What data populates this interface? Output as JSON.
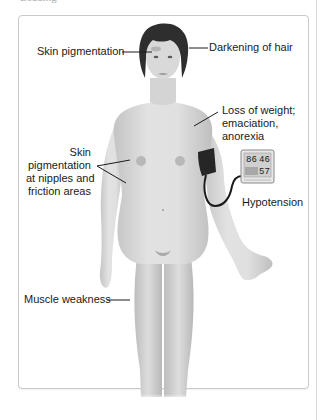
{
  "figure": {
    "caption_fragment": "Loading",
    "labels": {
      "skin_pigmentation_face": "Skin pigmentation",
      "darkening_of_hair": "Darkening of hair",
      "weight_loss": [
        "Loss of weight;",
        "emaciation,",
        "anorexia"
      ],
      "skin_pigmentation_body": [
        "Skin",
        "pigmentation",
        "at nipples and",
        "friction areas"
      ],
      "hypotension": "Hypotension",
      "muscle_weakness": "Muscle weakness"
    },
    "bp_monitor": {
      "systolic": "86",
      "diastolic": "46",
      "pulse": "57"
    },
    "colors": {
      "skin": "#d9d9d9",
      "skin_shadow": "#bdbdbd",
      "hair": "#2e2e2e",
      "cuff": "#262626",
      "leader_line": "#1a1a1a",
      "frame_border": "#c9c9c9"
    }
  }
}
